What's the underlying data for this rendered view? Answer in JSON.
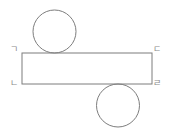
{
  "figure": {
    "background_color": "#ffffff",
    "stroke_color": "#7d7d7d",
    "label_color": "#8a8a8a",
    "stroke_width": 1,
    "rectangle": {
      "x": 22,
      "y": 53,
      "width": 130,
      "height": 31
    },
    "circles": [
      {
        "name": "top-circle",
        "cx": 54.5,
        "cy": 31.5,
        "r": 21.5,
        "tangent_edge": "rectangle-top"
      },
      {
        "name": "bottom-circle",
        "cx": 118,
        "cy": 105.5,
        "r": 21.5,
        "tangent_edge": "rectangle-bottom"
      }
    ],
    "labels": {
      "top_left": "ㄱ",
      "top_right": "ㄷ",
      "bottom_left": "ㄴ",
      "bottom_right": "ㄹ"
    }
  }
}
